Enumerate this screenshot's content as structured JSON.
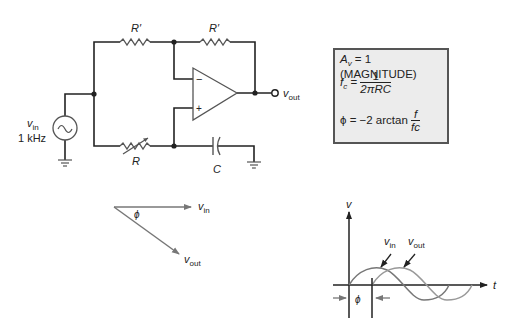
{
  "circuit": {
    "resistor_top_left_label": "R′",
    "resistor_feedback_label": "R′",
    "resistor_variable_label": "R",
    "capacitor_label": "C",
    "source_label_v": "v",
    "source_label_sub": "in",
    "source_frequency": "1 kHz",
    "opamp_inverting_sign": "−",
    "opamp_noninverting_sign": "+",
    "output_label_v": "v",
    "output_label_sub": "out"
  },
  "equations": {
    "gain_lhs": "A",
    "gain_sub": "v",
    "gain_rhs": " = 1 (MAGNITUDE)",
    "fc_lhs": "f",
    "fc_sub": "c",
    "fc_eq": " = ",
    "fc_num": "1",
    "fc_den": "2πRC",
    "phi_lhs": "ϕ = −2 arctan ",
    "phi_num": "f",
    "phi_den": "fc"
  },
  "phasor": {
    "vin_v": "v",
    "vin_sub": "in",
    "vout_v": "v",
    "vout_sub": "out",
    "angle_label": "ϕ"
  },
  "waveform": {
    "y_axis_label": "v",
    "x_axis_label": "t",
    "vin_v": "v",
    "vin_sub": "in",
    "vout_v": "v",
    "vout_sub": "out",
    "phase_label": "ϕ"
  },
  "colors": {
    "wire": "#222222",
    "gray_trace": "#777777",
    "box_fill": "#ececec",
    "box_border": "#555555"
  }
}
